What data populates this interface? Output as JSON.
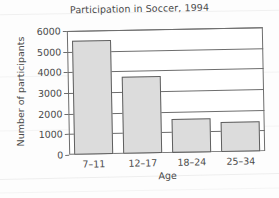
{
  "chart_data": {
    "type": "bar",
    "title": "Participation in Soccer, 1994",
    "xlabel": "Age",
    "ylabel": "Number of participants",
    "categories": [
      "7–11",
      "12–17",
      "18–24",
      "25–34"
    ],
    "values": [
      5500,
      3750,
      1650,
      1450
    ],
    "ylim": [
      0,
      6000
    ],
    "yticks": [
      0,
      1000,
      2000,
      3000,
      4000,
      5000,
      6000
    ],
    "ytick_labels": [
      "0",
      "1000",
      "2000",
      "3000",
      "4000",
      "5000",
      "6000"
    ],
    "grid": "horizontal",
    "legend": "none",
    "bar_fill_color": "#dcdcdc",
    "bar_edge_color": "#5f5f5f",
    "axis_color": "#6d6d6d",
    "background_color": "#fdfdfd"
  }
}
